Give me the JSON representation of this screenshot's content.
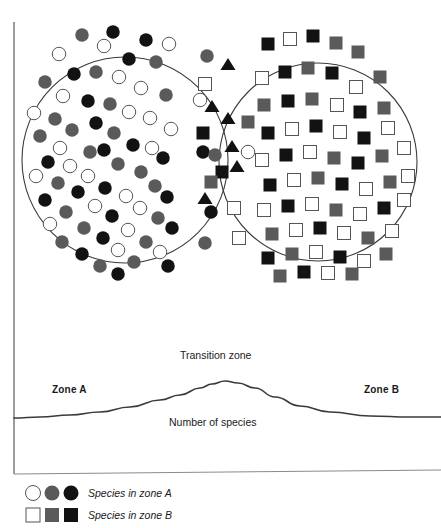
{
  "figure": {
    "type": "ecotone-venn-diagram",
    "title_visible": false,
    "background": "#ffffff",
    "stroke": "#3a3a3a"
  },
  "palette": {
    "white_fill": "#ffffff",
    "white_stroke": "#555555",
    "gray_fill": "#5a5a5a",
    "black_fill": "#121212",
    "outline": "#3a3a3a",
    "axis": "#5a5a5a",
    "curve": "#3a3a3a"
  },
  "venn": {
    "left_circle": {
      "cx": 125,
      "cy": 160,
      "r": 103,
      "symbol_shape": "circle",
      "zone": "Zone A"
    },
    "right_circle": {
      "cx": 318,
      "cy": 162,
      "r": 99,
      "symbol_shape": "square",
      "zone": "Zone B"
    },
    "overlap": {
      "x_from": 196,
      "x_to": 258,
      "top_intersection": [
        222,
        34
      ],
      "bottom_intersection": [
        222,
        285
      ],
      "symbol_shape": "triangle"
    }
  },
  "graph": {
    "axis_x": 14,
    "axis_top": 22,
    "axis_bottom": 474,
    "baseline_y": 418,
    "peak": {
      "x": 225,
      "y": 381
    },
    "labels": {
      "transition_zone": "Transition zone",
      "zone_a": "Zone A",
      "zone_b": "Zone B",
      "number_of_species": "Number of species"
    }
  },
  "legend": {
    "rows": [
      {
        "shape": "circle",
        "label": "Species in zone A",
        "swatches": [
          "white",
          "gray",
          "black"
        ],
        "y": 493
      },
      {
        "shape": "square",
        "label": "Species in zone B",
        "swatches": [
          "white",
          "gray",
          "black"
        ],
        "y": 515
      }
    ]
  },
  "chart_data": {
    "type": "line",
    "xlabel": "",
    "ylabel": "Number of species",
    "annotations": [
      "Zone A",
      "Transition zone",
      "Zone B",
      "Number of species"
    ],
    "grid": false,
    "legend_position": "bottom-left",
    "x": [
      14,
      40,
      70,
      100,
      130,
      160,
      180,
      200,
      212,
      225,
      238,
      255,
      275,
      300,
      330,
      370,
      410,
      441
    ],
    "y_curve": [
      418,
      417,
      415,
      412,
      407,
      400,
      395,
      388,
      384,
      381,
      383,
      388,
      397,
      406,
      412,
      416,
      417,
      417
    ],
    "series": [
      {
        "name": "Number of species",
        "values": [
          418,
          417,
          415,
          412,
          407,
          400,
          395,
          388,
          384,
          381,
          383,
          388,
          397,
          406,
          412,
          416,
          417,
          417
        ]
      }
    ],
    "symbol_counts": {
      "zone_a_circles_white": 26,
      "zone_a_circles_gray": 26,
      "zone_a_circles_black": 26,
      "zone_b_squares_white": 24,
      "zone_b_squares_gray": 17,
      "zone_b_squares_black": 23,
      "transition_triangles_black": 8
    }
  },
  "symbols": {
    "left": [
      [
        113,
        32,
        "black"
      ],
      [
        82,
        35,
        "gray"
      ],
      [
        146,
        40,
        "black"
      ],
      [
        169,
        44,
        "white"
      ],
      [
        104,
        46,
        "white"
      ],
      [
        59,
        54,
        "white"
      ],
      [
        129,
        59,
        "black"
      ],
      [
        156,
        62,
        "gray"
      ],
      [
        96,
        72,
        "gray"
      ],
      [
        74,
        74,
        "black"
      ],
      [
        119,
        77,
        "white"
      ],
      [
        45,
        82,
        "gray"
      ],
      [
        141,
        88,
        "white"
      ],
      [
        63,
        96,
        "white"
      ],
      [
        88,
        101,
        "black"
      ],
      [
        166,
        95,
        "gray"
      ],
      [
        110,
        104,
        "gray"
      ],
      [
        34,
        113,
        "white"
      ],
      [
        129,
        112,
        "white"
      ],
      [
        55,
        119,
        "gray"
      ],
      [
        96,
        123,
        "black"
      ],
      [
        150,
        118,
        "white"
      ],
      [
        72,
        130,
        "gray"
      ],
      [
        40,
        136,
        "gray"
      ],
      [
        114,
        133,
        "gray"
      ],
      [
        171,
        129,
        "white"
      ],
      [
        60,
        148,
        "white"
      ],
      [
        133,
        145,
        "black"
      ],
      [
        90,
        152,
        "gray"
      ],
      [
        104,
        150,
        "black"
      ],
      [
        152,
        148,
        "white"
      ],
      [
        48,
        162,
        "black"
      ],
      [
        70,
        166,
        "white"
      ],
      [
        118,
        164,
        "gray"
      ],
      [
        163,
        158,
        "black"
      ],
      [
        36,
        176,
        "white"
      ],
      [
        88,
        176,
        "white"
      ],
      [
        141,
        172,
        "gray"
      ],
      [
        58,
        183,
        "gray"
      ],
      [
        105,
        188,
        "black"
      ],
      [
        155,
        186,
        "gray"
      ],
      [
        78,
        192,
        "black"
      ],
      [
        126,
        196,
        "white"
      ],
      [
        45,
        200,
        "black"
      ],
      [
        167,
        197,
        "black"
      ],
      [
        95,
        206,
        "white"
      ],
      [
        140,
        208,
        "white"
      ],
      [
        66,
        212,
        "gray"
      ],
      [
        112,
        216,
        "black"
      ],
      [
        158,
        218,
        "gray"
      ],
      [
        50,
        224,
        "white"
      ],
      [
        84,
        228,
        "gray"
      ],
      [
        128,
        230,
        "white"
      ],
      [
        172,
        228,
        "black"
      ],
      [
        103,
        238,
        "black"
      ],
      [
        62,
        242,
        "gray"
      ],
      [
        146,
        242,
        "gray"
      ],
      [
        118,
        250,
        "white"
      ],
      [
        82,
        254,
        "black"
      ],
      [
        160,
        252,
        "white"
      ],
      [
        134,
        262,
        "gray"
      ],
      [
        100,
        266,
        "gray"
      ],
      [
        168,
        266,
        "black"
      ],
      [
        118,
        274,
        "black"
      ]
    ],
    "overlap": [
      [
        207,
        56,
        "circle",
        "gray"
      ],
      [
        228,
        64,
        "triangle",
        "black"
      ],
      [
        205,
        84,
        "square",
        "white"
      ],
      [
        200,
        100,
        "circle",
        "white"
      ],
      [
        212,
        106,
        "triangle",
        "black"
      ],
      [
        228,
        118,
        "triangle",
        "black"
      ],
      [
        248,
        122,
        "square",
        "gray"
      ],
      [
        203,
        133,
        "square",
        "black"
      ],
      [
        232,
        146,
        "triangle",
        "black"
      ],
      [
        203,
        152,
        "circle",
        "black"
      ],
      [
        215,
        155,
        "circle",
        "gray"
      ],
      [
        248,
        152,
        "circle",
        "white"
      ],
      [
        237,
        166,
        "triangle",
        "black"
      ],
      [
        222,
        172,
        "square",
        "black"
      ],
      [
        211,
        182,
        "square",
        "gray"
      ],
      [
        205,
        198,
        "triangle",
        "black"
      ],
      [
        211,
        212,
        "circle",
        "black"
      ],
      [
        234,
        208,
        "square",
        "white"
      ],
      [
        239,
        238,
        "square",
        "white"
      ],
      [
        205,
        243,
        "circle",
        "gray"
      ]
    ],
    "right": [
      [
        268,
        44,
        "black"
      ],
      [
        290,
        39,
        "white"
      ],
      [
        313,
        36,
        "black"
      ],
      [
        336,
        43,
        "gray"
      ],
      [
        262,
        78,
        "white"
      ],
      [
        285,
        72,
        "black"
      ],
      [
        308,
        68,
        "gray"
      ],
      [
        332,
        73,
        "black"
      ],
      [
        358,
        52,
        "gray"
      ],
      [
        356,
        87,
        "white"
      ],
      [
        380,
        77,
        "gray"
      ],
      [
        264,
        105,
        "gray"
      ],
      [
        288,
        101,
        "black"
      ],
      [
        312,
        99,
        "gray"
      ],
      [
        337,
        105,
        "white"
      ],
      [
        360,
        112,
        "black"
      ],
      [
        384,
        108,
        "gray"
      ],
      [
        268,
        133,
        "black"
      ],
      [
        292,
        129,
        "white"
      ],
      [
        316,
        126,
        "black"
      ],
      [
        340,
        132,
        "white"
      ],
      [
        364,
        138,
        "black"
      ],
      [
        388,
        128,
        "white"
      ],
      [
        262,
        160,
        "white"
      ],
      [
        286,
        155,
        "black"
      ],
      [
        310,
        152,
        "white"
      ],
      [
        334,
        158,
        "gray"
      ],
      [
        358,
        163,
        "black"
      ],
      [
        382,
        156,
        "gray"
      ],
      [
        404,
        148,
        "white"
      ],
      [
        270,
        185,
        "black"
      ],
      [
        294,
        180,
        "white"
      ],
      [
        318,
        178,
        "gray"
      ],
      [
        342,
        184,
        "black"
      ],
      [
        366,
        189,
        "white"
      ],
      [
        390,
        182,
        "gray"
      ],
      [
        408,
        176,
        "white"
      ],
      [
        264,
        210,
        "white"
      ],
      [
        288,
        206,
        "black"
      ],
      [
        312,
        204,
        "white"
      ],
      [
        336,
        210,
        "gray"
      ],
      [
        360,
        214,
        "white"
      ],
      [
        384,
        208,
        "black"
      ],
      [
        404,
        200,
        "white"
      ],
      [
        272,
        234,
        "gray"
      ],
      [
        296,
        230,
        "white"
      ],
      [
        320,
        228,
        "black"
      ],
      [
        344,
        233,
        "white"
      ],
      [
        368,
        238,
        "gray"
      ],
      [
        392,
        231,
        "white"
      ],
      [
        268,
        258,
        "black"
      ],
      [
        292,
        254,
        "gray"
      ],
      [
        316,
        252,
        "white"
      ],
      [
        340,
        257,
        "black"
      ],
      [
        364,
        261,
        "white"
      ],
      [
        386,
        254,
        "gray"
      ],
      [
        280,
        276,
        "gray"
      ],
      [
        304,
        272,
        "black"
      ],
      [
        328,
        273,
        "white"
      ],
      [
        352,
        274,
        "gray"
      ]
    ]
  }
}
